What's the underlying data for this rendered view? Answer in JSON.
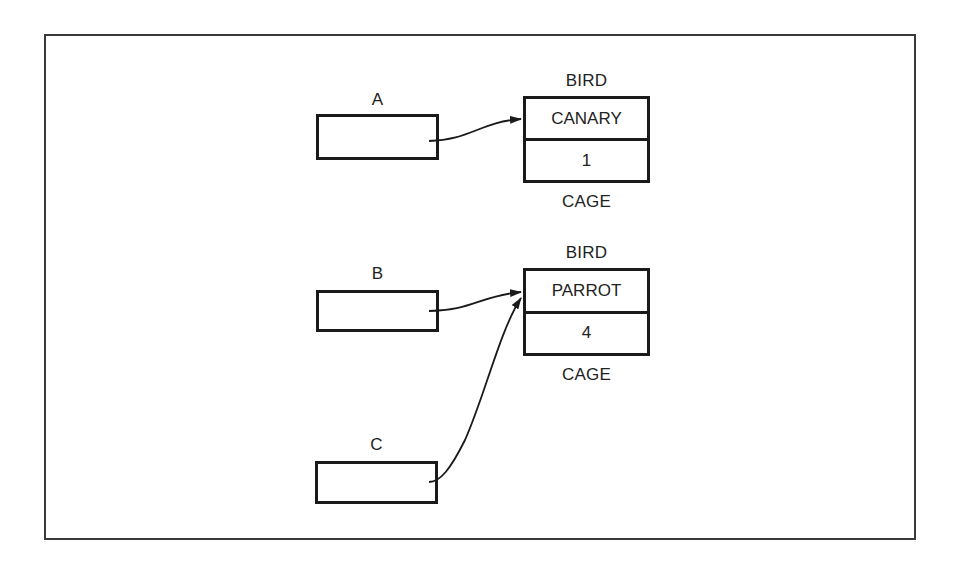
{
  "diagram": {
    "pointers": [
      {
        "name": "A"
      },
      {
        "name": "B"
      },
      {
        "name": "C"
      }
    ],
    "records": [
      {
        "type_label": "BIRD",
        "field1": "CANARY",
        "field2": "1",
        "field2_label": "CAGE"
      },
      {
        "type_label": "BIRD",
        "field1": "PARROT",
        "field2": "4",
        "field2_label": "CAGE"
      }
    ],
    "edges": [
      {
        "from": "A",
        "to": "record 0 (CANARY)"
      },
      {
        "from": "B",
        "to": "record 1 (PARROT)"
      },
      {
        "from": "C",
        "to": "record 1 (PARROT)"
      }
    ]
  }
}
